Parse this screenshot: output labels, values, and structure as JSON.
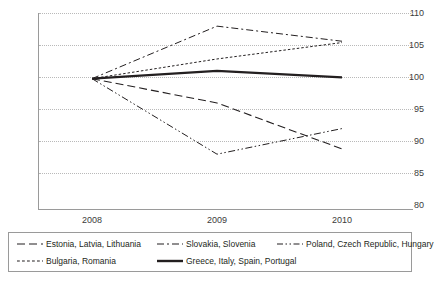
{
  "chart_data": {
    "type": "line",
    "title": "",
    "xlabel": "",
    "ylabel": "",
    "x": [
      "2008",
      "2009",
      "2010"
    ],
    "categories": [
      "2008",
      "2009",
      "2010"
    ],
    "ylim": [
      80,
      110
    ],
    "yticks": [
      80,
      85,
      90,
      95,
      100,
      105,
      110
    ],
    "ytick_labels": [
      "80",
      "85",
      "90",
      "95",
      "100",
      "105",
      "110"
    ],
    "grid": "horizontal-dotted",
    "legend_position": "bottom",
    "series": [
      {
        "name": "Estonia, Latvia, Lithuania",
        "values": [
          100,
          96.3,
          89.3
        ],
        "dash": "8,4",
        "width": 1.1,
        "color": "#231f20"
      },
      {
        "name": "Slovakia, Slovenia",
        "values": [
          100,
          108.0,
          105.7
        ],
        "dash": "7,3,2,3",
        "width": 1.0,
        "color": "#231f20"
      },
      {
        "name": "Poland, Czech Republic, Hungary",
        "values": [
          100,
          88.5,
          92.4
        ],
        "dash": "7,2.5,1.5,2.5,1.5,2.5",
        "width": 1.0,
        "color": "#231f20"
      },
      {
        "name": "Bulgaria, Romania",
        "values": [
          100,
          103.0,
          105.5
        ],
        "dash": "2.5,2",
        "width": 1.0,
        "color": "#231f20"
      },
      {
        "name": "Greece, Italy, Spain, Portugal",
        "values": [
          100,
          101.2,
          100.2
        ],
        "dash": "none",
        "width": 2.2,
        "color": "#231f20"
      }
    ]
  },
  "axes": {
    "y_labels": [
      "110",
      "105",
      "100",
      "95",
      "90",
      "85",
      "80"
    ],
    "x_labels": [
      "2008",
      "2009",
      "2010"
    ]
  },
  "legend": {
    "items": [
      {
        "label": "Estonia, Latvia, Lithuania",
        "style": "long-dash"
      },
      {
        "label": "Slovakia, Slovenia",
        "style": "dash-dot"
      },
      {
        "label": "Poland, Czech Republic, Hungary",
        "style": "dash-dot-dot"
      },
      {
        "label": "Bulgaria, Romania",
        "style": "dotted"
      },
      {
        "label": "Greece, Italy, Spain, Portugal",
        "style": "solid-thick"
      }
    ]
  },
  "colors": {
    "line": "#231f20",
    "axis": "#9a9a9a",
    "grid": "#b9b9b9",
    "text": "#3b3b3b",
    "background": "#ffffff"
  }
}
